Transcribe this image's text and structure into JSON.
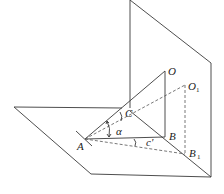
{
  "diagram": {
    "type": "3d-geometry",
    "colors": {
      "line": "#3a3a3a",
      "dashed": "#555555",
      "background": "#ffffff"
    },
    "points": {
      "A": {
        "label": "A",
        "x": 85,
        "y": 139
      },
      "O": {
        "label": "O",
        "x": 165,
        "y": 71
      },
      "B": {
        "label": "B",
        "x": 165,
        "y": 137
      },
      "O1": {
        "label": "O",
        "subscript": "1",
        "x": 185,
        "y": 85
      },
      "B1": {
        "label": "B",
        "subscript": "1",
        "x": 185,
        "y": 154
      },
      "C": {
        "label": "C",
        "x": 125,
        "y": 111
      }
    },
    "angles": {
      "alpha": {
        "label": "α"
      },
      "c_top": {
        "label": "c"
      },
      "c_prime": {
        "label": "c'"
      }
    },
    "caption": ""
  }
}
